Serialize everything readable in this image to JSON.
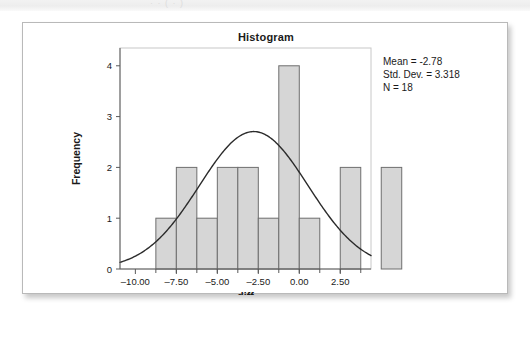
{
  "top_strip": {
    "ghost_text": "·   ·  ( · )"
  },
  "chart_data": {
    "type": "bar",
    "title": "Histogram",
    "xlabel": "diff",
    "ylabel": "Frequency",
    "xlim": [
      -10.9375,
      4.375
    ],
    "ylim": [
      0,
      4.35
    ],
    "xticks": [
      -10,
      -7.5,
      -5,
      -2.5,
      0,
      2.5
    ],
    "xtick_labels": [
      "–10.00",
      "–7.50",
      "–5.00",
      "–2.50",
      "0.00",
      "2.50"
    ],
    "yticks": [
      0,
      1,
      2,
      3,
      4
    ],
    "ytick_labels": [
      "0",
      "1",
      "2",
      "3",
      "4"
    ],
    "grid": false,
    "bin_width": 1.25,
    "bin_edges": [
      -8.75,
      -7.5,
      -6.25,
      -5.0,
      -3.75,
      -2.5,
      -1.25,
      0.0,
      1.25,
      2.5,
      3.75,
      5.0,
      6.25
    ],
    "bin_centers": [
      -8.125,
      -6.875,
      -5.625,
      -4.375,
      -3.125,
      -1.875,
      -0.625,
      0.625,
      1.875,
      3.125,
      4.375,
      5.625
    ],
    "values": [
      1,
      2,
      1,
      2,
      2,
      1,
      4,
      1,
      0,
      2,
      0,
      2
    ],
    "curve": {
      "name": "normal",
      "mean": -2.78,
      "std_dev": 3.318,
      "n": 18,
      "scale": "n * bin_width"
    },
    "annotations": [
      "Mean = -2.78",
      "Std. Dev. = 3.318",
      "N = 18"
    ]
  },
  "statistics": {
    "mean_label": "Mean = -2.78",
    "std_dev_label": "Std. Dev. = 3.318",
    "n_label": "N = 18"
  }
}
